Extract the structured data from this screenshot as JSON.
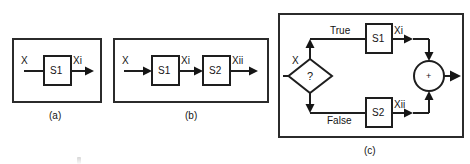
{
  "figure": {
    "panels": [
      {
        "id": "a",
        "caption": "(a)",
        "type": "single-process",
        "input_label": "X",
        "nodes": [
          {
            "name": "S1",
            "shape": "rectangle"
          }
        ],
        "edges": [
          {
            "from": "X",
            "to": "S1",
            "label": ""
          },
          {
            "from": "S1",
            "to": "output",
            "label": "Xi"
          }
        ]
      },
      {
        "id": "b",
        "caption": "(b)",
        "type": "sequential-process",
        "input_label": "X",
        "nodes": [
          {
            "name": "S1",
            "shape": "rectangle"
          },
          {
            "name": "S2",
            "shape": "rectangle"
          }
        ],
        "edges": [
          {
            "from": "X",
            "to": "S1",
            "label": ""
          },
          {
            "from": "S1",
            "to": "S2",
            "label": "Xi"
          },
          {
            "from": "S2",
            "to": "output",
            "label": "Xii"
          }
        ]
      },
      {
        "id": "c",
        "caption": "(c)",
        "type": "conditional-branch-merge",
        "input_label": "X",
        "decision_symbol": "?",
        "merge_symbol": "+",
        "branch_true_label": "True",
        "branch_false_label": "False",
        "nodes": [
          {
            "name": "?",
            "shape": "diamond"
          },
          {
            "name": "S1",
            "shape": "rectangle"
          },
          {
            "name": "S2",
            "shape": "rectangle"
          },
          {
            "name": "+",
            "shape": "circle"
          }
        ],
        "edges": [
          {
            "from": "X",
            "to": "?",
            "label": ""
          },
          {
            "from": "?",
            "to": "S1",
            "label": "True"
          },
          {
            "from": "?",
            "to": "S2",
            "label": "False"
          },
          {
            "from": "S1",
            "to": "+",
            "label": "Xi"
          },
          {
            "from": "S2",
            "to": "+",
            "label": "Xii"
          },
          {
            "from": "+",
            "to": "output",
            "label": ""
          }
        ]
      }
    ]
  },
  "labels": {
    "input_x": "X",
    "sig_xi": "Xi",
    "sig_xii": "Xii",
    "proc_s1": "S1",
    "proc_s2": "S2",
    "cond_true": "True",
    "cond_false": "False",
    "decision_mark": "?",
    "merge_op": "+",
    "caption_a": "(a)",
    "caption_b": "(b)",
    "caption_c": "(c)"
  },
  "colors": {
    "ink": "#1e1e1e",
    "panel_stroke": "#2b2b2b",
    "background": "#ffffff"
  }
}
